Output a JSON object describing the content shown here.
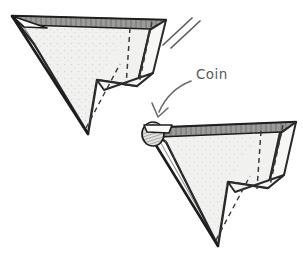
{
  "figure": {
    "background_color": "#ffffff",
    "width": 303,
    "height": 260
  },
  "palette": {
    "ink": "#1d1d1d",
    "outline": "#2a2a2a",
    "paper_fill": "#f1f1ef",
    "paper_fill_light": "#f7f7f5",
    "spine_shade": "#9b9b99",
    "spine_shade_dark": "#6e6e6c",
    "fold_dash": "#3a3a3a",
    "stipple": "#b9b9b7",
    "label_ink": "#5a5a5a",
    "arrow_ink": "#6b6b6b",
    "coin_fill": "#e3e3e1",
    "coin_hatch": "#3d3d3d"
  },
  "annotations": {
    "coin_label": "Coin",
    "coin_label_position": {
      "x": 196,
      "y": 74
    },
    "arrow": {
      "name": "curved-arrow-to-coin",
      "from": {
        "x": 192,
        "y": 78
      },
      "to": {
        "x": 160,
        "y": 116
      }
    },
    "repeat_marks": {
      "name": "repeat-double-slash",
      "count": 2,
      "position": {
        "x": 168,
        "y": 22
      }
    }
  },
  "shapes": {
    "upper_plane": {
      "name": "paper-plane-upper",
      "nose": {
        "x": 12,
        "y": 16
      },
      "tail_tip": {
        "x": 166,
        "y": 20
      },
      "bottom_tip": {
        "x": 88,
        "y": 134
      }
    },
    "lower_plane": {
      "name": "paper-plane-lower",
      "nose": {
        "x": 146,
        "y": 128
      },
      "tail_tip": {
        "x": 296,
        "y": 122
      },
      "bottom_tip": {
        "x": 218,
        "y": 246
      },
      "coin": {
        "x": 152,
        "y": 134,
        "rx": 11,
        "ry": 12
      }
    }
  },
  "legend": {
    "solid_line": "cut or visible edge",
    "dashed_line": "fold line",
    "dotted_area": "paper texture"
  }
}
